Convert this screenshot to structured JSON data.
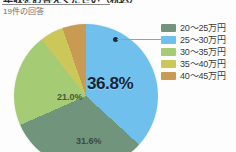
{
  "header": {
    "title": "年収をお答えください（税込）",
    "subtitle": "19件の回答"
  },
  "callout": {
    "dot_name": "callout-dot",
    "target_series": "25～30万円"
  },
  "legend": {
    "position": "right",
    "items": [
      {
        "label": "20～25万円",
        "color": "#71947c"
      },
      {
        "label": "25～30万円",
        "color": "#6fc0ec"
      },
      {
        "label": "30～35万円",
        "color": "#a5cc74"
      },
      {
        "label": "35～40万円",
        "color": "#ccc759"
      },
      {
        "label": "40～45万円",
        "color": "#c99a52"
      }
    ]
  },
  "labels": {
    "main": "36.8%",
    "green": "21.0%",
    "teal": "31.6%"
  },
  "chart_data": {
    "type": "pie",
    "title": "年収をお答えください（税込）",
    "subtitle": "19件の回答",
    "total_responses": 19,
    "categories": [
      "25～30万円",
      "20～25万円",
      "30～35万円",
      "35～40万円",
      "40～45万円"
    ],
    "values": [
      36.8,
      31.6,
      21.0,
      5.3,
      5.3
    ],
    "value_unit": "%",
    "counts": [
      7,
      6,
      4,
      1,
      1
    ],
    "colors": [
      "#6fc0ec",
      "#71947c",
      "#a5cc74",
      "#ccc759",
      "#c99a52"
    ],
    "visible_labels": [
      "36.8%",
      "31.6%",
      "21.0%"
    ],
    "legend": [
      "20～25万円",
      "25～30万円",
      "30～35万円",
      "35～40万円",
      "40～45万円"
    ],
    "legend_position": "right",
    "start_angle_deg": 0,
    "direction": "clockwise",
    "grid": false
  }
}
